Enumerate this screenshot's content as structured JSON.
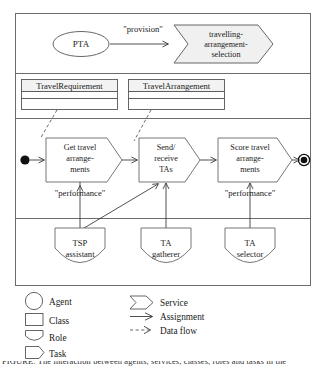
{
  "diagram": {
    "service_lane": {
      "agent": {
        "name": "PTA",
        "shape": "ellipse"
      },
      "edge_label": "\"provision\"",
      "service": {
        "line1": "travelling-",
        "line2": "arrangement-",
        "line3": "selection"
      }
    },
    "class_lane": {
      "classes": [
        {
          "name": "TravelRequirement"
        },
        {
          "name": "TravelArrangement"
        }
      ]
    },
    "task_lane": {
      "start_node": "start",
      "end_node": "end",
      "tasks": [
        {
          "line1": "Get travel",
          "line2": "arrange-",
          "line3": "ments"
        },
        {
          "line1": "Send/",
          "line2": "receive",
          "line3": "TAs"
        },
        {
          "line1": "Score travel",
          "line2": "arrange-",
          "line3": "ments"
        }
      ],
      "edge_labels": [
        "\"performance\"",
        "\"performance\""
      ]
    },
    "role_lane": {
      "roles": [
        {
          "line1": "TSP",
          "line2": "assistant"
        },
        {
          "line1": "TA",
          "line2": "gatherer"
        },
        {
          "line1": "TA",
          "line2": "selector"
        }
      ]
    },
    "legend": {
      "shapes": [
        {
          "label": "Agent",
          "glyph": "circle"
        },
        {
          "label": "Class",
          "glyph": "rectangle"
        },
        {
          "label": "Role",
          "glyph": "shield"
        },
        {
          "label": "Task",
          "glyph": "pentagon"
        }
      ],
      "relations": [
        {
          "label": "Service",
          "glyph": "chevron"
        },
        {
          "label": "Assignment",
          "glyph": "solid-arrow"
        },
        {
          "label": "Data flow",
          "glyph": "dashed-arrow"
        }
      ]
    },
    "caption": "FIGURE: The interaction between agents, services, classes, roles and tasks in the"
  },
  "colors": {
    "stroke": "#555555",
    "frame": "#6b6b6b",
    "fill_light": "#f2f2f2",
    "text": "#1a1a1a"
  }
}
